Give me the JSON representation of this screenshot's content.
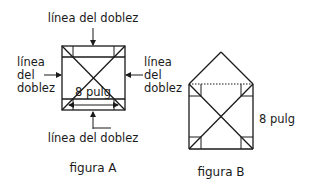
{
  "figure_a": {
    "caption": "figura A",
    "label_top": "línea del doblez",
    "label_bottom": "línea del doblez",
    "label_left": [
      "línea",
      "del",
      "doblez"
    ],
    "label_right": [
      "línea",
      "del",
      "doblez"
    ],
    "measurement": "8 pulg"
  },
  "figure_b": {
    "caption": "figura B",
    "measurement": "8 pulg"
  },
  "colors": {
    "line": "#1a1a1a",
    "background": "#ffffff"
  }
}
